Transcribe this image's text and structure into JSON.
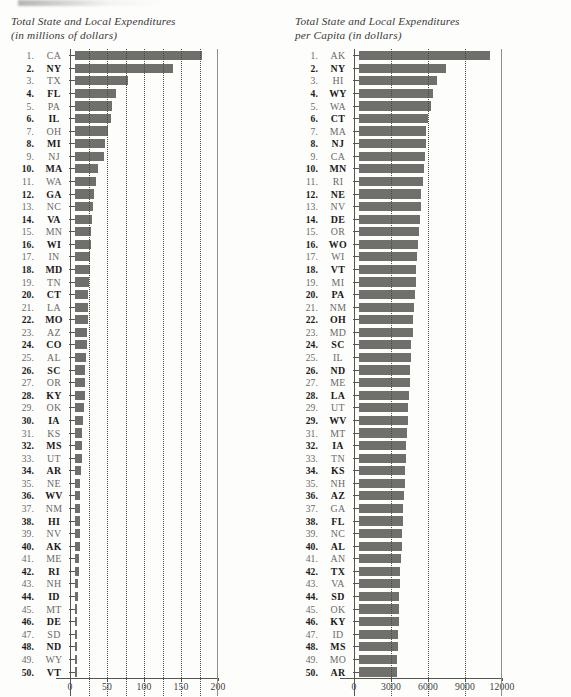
{
  "page": {
    "background_color": "#fdfdfc",
    "bar_color": "#6f6f6c",
    "text_color": "#3a3a38"
  },
  "charts": [
    {
      "id": "total-expenditures",
      "title": "Total State and Local Expenditures\n(in millions of dollars)",
      "axis": {
        "labels": [
          "0",
          "50",
          "100",
          "150",
          "200"
        ],
        "min": 0,
        "max": 200,
        "label_step": 50,
        "gridline_step": 25
      },
      "rows": [
        {
          "rank": "1.",
          "abbr": "CA",
          "value": 172
        },
        {
          "rank": "2.",
          "abbr": "NY",
          "value": 133
        },
        {
          "rank": "3.",
          "abbr": "TX",
          "value": 71
        },
        {
          "rank": "4.",
          "abbr": "FL",
          "value": 55
        },
        {
          "rank": "5.",
          "abbr": "PA",
          "value": 50
        },
        {
          "rank": "6.",
          "abbr": "IL",
          "value": 48
        },
        {
          "rank": "7.",
          "abbr": "OH",
          "value": 44
        },
        {
          "rank": "8.",
          "abbr": "MI",
          "value": 41
        },
        {
          "rank": "9.",
          "abbr": "NJ",
          "value": 39
        },
        {
          "rank": "10.",
          "abbr": "MA",
          "value": 31
        },
        {
          "rank": "11.",
          "abbr": "WA",
          "value": 28
        },
        {
          "rank": "12.",
          "abbr": "GA",
          "value": 25
        },
        {
          "rank": "13.",
          "abbr": "NC",
          "value": 24
        },
        {
          "rank": "14.",
          "abbr": "VA",
          "value": 23
        },
        {
          "rank": "15.",
          "abbr": "MN",
          "value": 22
        },
        {
          "rank": "16.",
          "abbr": "WI",
          "value": 21
        },
        {
          "rank": "17.",
          "abbr": "IN",
          "value": 20
        },
        {
          "rank": "18.",
          "abbr": "MD",
          "value": 20
        },
        {
          "rank": "19.",
          "abbr": "TN",
          "value": 19
        },
        {
          "rank": "20.",
          "abbr": "CT",
          "value": 18
        },
        {
          "rank": "21.",
          "abbr": "LA",
          "value": 17
        },
        {
          "rank": "22.",
          "abbr": "MO",
          "value": 17
        },
        {
          "rank": "23.",
          "abbr": "AZ",
          "value": 16
        },
        {
          "rank": "24.",
          "abbr": "CO",
          "value": 16
        },
        {
          "rank": "25.",
          "abbr": "AL",
          "value": 15
        },
        {
          "rank": "26.",
          "abbr": "SC",
          "value": 14
        },
        {
          "rank": "27.",
          "abbr": "OR",
          "value": 13
        },
        {
          "rank": "28.",
          "abbr": "KY",
          "value": 13
        },
        {
          "rank": "29.",
          "abbr": "OK",
          "value": 12
        },
        {
          "rank": "30.",
          "abbr": "IA",
          "value": 11
        },
        {
          "rank": "31.",
          "abbr": "KS",
          "value": 10
        },
        {
          "rank": "32.",
          "abbr": "MS",
          "value": 9
        },
        {
          "rank": "33.",
          "abbr": "UT",
          "value": 9
        },
        {
          "rank": "34.",
          "abbr": "AR",
          "value": 8
        },
        {
          "rank": "35.",
          "abbr": "NE",
          "value": 7
        },
        {
          "rank": "36.",
          "abbr": "WV",
          "value": 7
        },
        {
          "rank": "37.",
          "abbr": "NM",
          "value": 7
        },
        {
          "rank": "38.",
          "abbr": "HI",
          "value": 7
        },
        {
          "rank": "39.",
          "abbr": "NV",
          "value": 7
        },
        {
          "rank": "40.",
          "abbr": "AK",
          "value": 7
        },
        {
          "rank": "41.",
          "abbr": "ME",
          "value": 5
        },
        {
          "rank": "42.",
          "abbr": "RI",
          "value": 5
        },
        {
          "rank": "43.",
          "abbr": "NH",
          "value": 4
        },
        {
          "rank": "44.",
          "abbr": "ID",
          "value": 4
        },
        {
          "rank": "45.",
          "abbr": "MT",
          "value": 3
        },
        {
          "rank": "46.",
          "abbr": "DE",
          "value": 3
        },
        {
          "rank": "47.",
          "abbr": "SD",
          "value": 3
        },
        {
          "rank": "48.",
          "abbr": "ND",
          "value": 3
        },
        {
          "rank": "49.",
          "abbr": "WY",
          "value": 2
        },
        {
          "rank": "50.",
          "abbr": "VT",
          "value": 2
        }
      ]
    },
    {
      "id": "per-capita-expenditures",
      "title": "Total State and Local Expenditures\nper Capita (in dollars)",
      "axis": {
        "labels": [
          "0",
          "3000",
          "6000",
          "9000",
          "12000"
        ],
        "min": 0,
        "max": 12000,
        "label_step": 3000,
        "gridline_step": 3000
      },
      "rows": [
        {
          "rank": "1.",
          "abbr": "AK",
          "value": 10600
        },
        {
          "rank": "2.",
          "abbr": "NY",
          "value": 7050
        },
        {
          "rank": "3.",
          "abbr": "HI",
          "value": 6350
        },
        {
          "rank": "4.",
          "abbr": "WY",
          "value": 6000
        },
        {
          "rank": "5.",
          "abbr": "WA",
          "value": 5800
        },
        {
          "rank": "6.",
          "abbr": "CT",
          "value": 5600
        },
        {
          "rank": "7.",
          "abbr": "MA",
          "value": 5450
        },
        {
          "rank": "8.",
          "abbr": "NJ",
          "value": 5400
        },
        {
          "rank": "9.",
          "abbr": "CA",
          "value": 5350
        },
        {
          "rank": "10.",
          "abbr": "MN",
          "value": 5250
        },
        {
          "rank": "11.",
          "abbr": "RI",
          "value": 5150
        },
        {
          "rank": "12.",
          "abbr": "NE",
          "value": 5050
        },
        {
          "rank": "13.",
          "abbr": "NV",
          "value": 5000
        },
        {
          "rank": "14.",
          "abbr": "DE",
          "value": 4950
        },
        {
          "rank": "15.",
          "abbr": "OR",
          "value": 4900
        },
        {
          "rank": "16.",
          "abbr": "WO",
          "value": 4800
        },
        {
          "rank": "17.",
          "abbr": "WI",
          "value": 4700
        },
        {
          "rank": "18.",
          "abbr": "VT",
          "value": 4650
        },
        {
          "rank": "19.",
          "abbr": "MI",
          "value": 4600
        },
        {
          "rank": "20.",
          "abbr": "PA",
          "value": 4500
        },
        {
          "rank": "21.",
          "abbr": "NM",
          "value": 4450
        },
        {
          "rank": "22.",
          "abbr": "OH",
          "value": 4400
        },
        {
          "rank": "23.",
          "abbr": "MD",
          "value": 4350
        },
        {
          "rank": "24.",
          "abbr": "SC",
          "value": 4250
        },
        {
          "rank": "25.",
          "abbr": "IL",
          "value": 4200
        },
        {
          "rank": "26.",
          "abbr": "ND",
          "value": 4150
        },
        {
          "rank": "27.",
          "abbr": "ME",
          "value": 4100
        },
        {
          "rank": "28.",
          "abbr": "LA",
          "value": 4050
        },
        {
          "rank": "29.",
          "abbr": "UT",
          "value": 4000
        },
        {
          "rank": "29.",
          "abbr": "WV",
          "value": 3950
        },
        {
          "rank": "31.",
          "abbr": "MT",
          "value": 3900
        },
        {
          "rank": "32.",
          "abbr": "IA",
          "value": 3850
        },
        {
          "rank": "33.",
          "abbr": "TN",
          "value": 3800
        },
        {
          "rank": "34.",
          "abbr": "KS",
          "value": 3750
        },
        {
          "rank": "35.",
          "abbr": "NH",
          "value": 3700
        },
        {
          "rank": "36.",
          "abbr": "AZ",
          "value": 3650
        },
        {
          "rank": "37.",
          "abbr": "GA",
          "value": 3600
        },
        {
          "rank": "38.",
          "abbr": "FL",
          "value": 3550
        },
        {
          "rank": "39.",
          "abbr": "NC",
          "value": 3500
        },
        {
          "rank": "40.",
          "abbr": "AL",
          "value": 3450
        },
        {
          "rank": "41.",
          "abbr": "AN",
          "value": 3400
        },
        {
          "rank": "42.",
          "abbr": "TX",
          "value": 3350
        },
        {
          "rank": "43.",
          "abbr": "VA",
          "value": 3320
        },
        {
          "rank": "44.",
          "abbr": "SD",
          "value": 3280
        },
        {
          "rank": "45.",
          "abbr": "OK",
          "value": 3250
        },
        {
          "rank": "46.",
          "abbr": "KY",
          "value": 3220
        },
        {
          "rank": "47.",
          "abbr": "ID",
          "value": 3180
        },
        {
          "rank": "48.",
          "abbr": "MS",
          "value": 3150
        },
        {
          "rank": "49.",
          "abbr": "MO",
          "value": 3120
        },
        {
          "rank": "50.",
          "abbr": "AR",
          "value": 3050
        }
      ]
    }
  ],
  "chart_data": [
    {
      "type": "bar",
      "orientation": "horizontal",
      "title": "Total State and Local Expenditures (in millions of dollars)",
      "xlabel": "",
      "ylabel": "",
      "xlim": [
        0,
        200
      ],
      "xticks": [
        0,
        50,
        100,
        150,
        200
      ],
      "gridlines": [
        25,
        50,
        75,
        100,
        125,
        150,
        175
      ],
      "grid": true,
      "legend": "none",
      "categories": [
        "CA",
        "NY",
        "TX",
        "FL",
        "PA",
        "IL",
        "OH",
        "MI",
        "NJ",
        "MA",
        "WA",
        "GA",
        "NC",
        "VA",
        "MN",
        "WI",
        "IN",
        "MD",
        "TN",
        "CT",
        "LA",
        "MO",
        "AZ",
        "CO",
        "AL",
        "SC",
        "OR",
        "KY",
        "OK",
        "IA",
        "KS",
        "MS",
        "UT",
        "AR",
        "NE",
        "WV",
        "NM",
        "HI",
        "NV",
        "AK",
        "ME",
        "RI",
        "NH",
        "ID",
        "MT",
        "DE",
        "SD",
        "ND",
        "WY",
        "VT"
      ],
      "values": [
        172,
        133,
        71,
        55,
        50,
        48,
        44,
        41,
        39,
        31,
        28,
        25,
        24,
        23,
        22,
        21,
        20,
        20,
        19,
        18,
        17,
        17,
        16,
        16,
        15,
        14,
        13,
        13,
        12,
        11,
        10,
        9,
        9,
        8,
        7,
        7,
        7,
        7,
        7,
        7,
        5,
        5,
        4,
        4,
        3,
        3,
        3,
        3,
        2,
        2
      ]
    },
    {
      "type": "bar",
      "orientation": "horizontal",
      "title": "Total State and Local Expenditures per Capita (in dollars)",
      "xlabel": "",
      "ylabel": "",
      "xlim": [
        0,
        12000
      ],
      "xticks": [
        0,
        3000,
        6000,
        9000,
        12000
      ],
      "gridlines": [
        3000,
        6000,
        9000
      ],
      "grid": true,
      "legend": "none",
      "categories": [
        "AK",
        "NY",
        "HI",
        "WY",
        "WA",
        "CT",
        "MA",
        "NJ",
        "CA",
        "MN",
        "RI",
        "NE",
        "NV",
        "DE",
        "OR",
        "WO",
        "WI",
        "VT",
        "MI",
        "PA",
        "NM",
        "OH",
        "MD",
        "SC",
        "IL",
        "ND",
        "ME",
        "LA",
        "UT",
        "WV",
        "MT",
        "IA",
        "TN",
        "KS",
        "NH",
        "AZ",
        "GA",
        "FL",
        "NC",
        "AL",
        "AN",
        "TX",
        "VA",
        "SD",
        "OK",
        "KY",
        "ID",
        "MS",
        "MO",
        "AR"
      ],
      "values": [
        10600,
        7050,
        6350,
        6000,
        5800,
        5600,
        5450,
        5400,
        5350,
        5250,
        5150,
        5050,
        5000,
        4950,
        4900,
        4800,
        4700,
        4650,
        4600,
        4500,
        4450,
        4400,
        4350,
        4250,
        4200,
        4150,
        4100,
        4050,
        4000,
        3950,
        3900,
        3850,
        3800,
        3750,
        3700,
        3650,
        3600,
        3550,
        3500,
        3450,
        3400,
        3350,
        3320,
        3280,
        3250,
        3220,
        3180,
        3150,
        3120,
        3050
      ]
    }
  ]
}
